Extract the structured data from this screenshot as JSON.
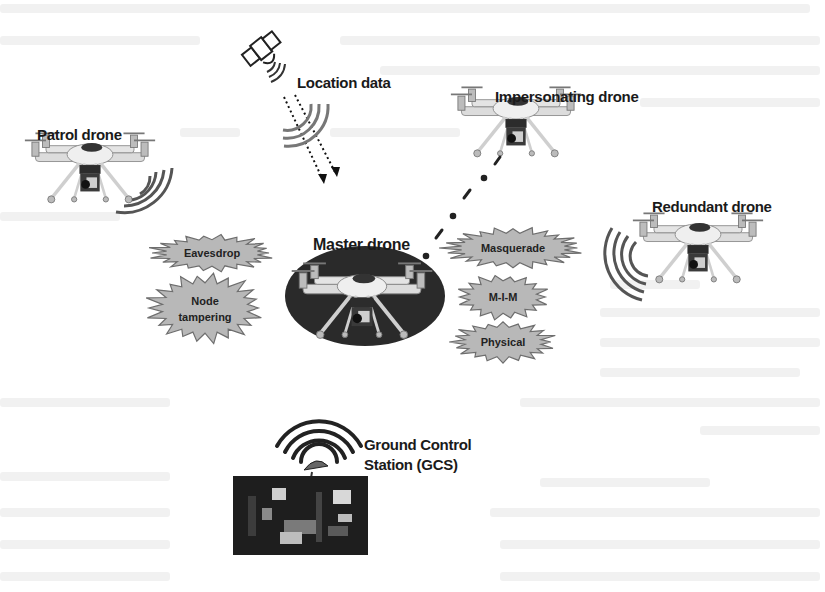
{
  "figure": {
    "nodes": {
      "satellite": {
        "label": "Location data",
        "icon": "satellite-icon"
      },
      "patrol": {
        "label": "Patrol drone",
        "icon": "drone-icon"
      },
      "impersonating": {
        "label": "Impersonating drone",
        "icon": "drone-icon"
      },
      "redundant": {
        "label": "Redundant drone",
        "icon": "drone-icon"
      },
      "master": {
        "label": "Master drone",
        "icon": "drone-icon"
      },
      "gcs": {
        "label_line1": "Ground Control",
        "label_line2": "Station (GCS)",
        "icon": "ground-station-icon"
      }
    },
    "attacks": [
      {
        "label": "Eavesdrop"
      },
      {
        "label_line1": "Node",
        "label_line2": "tampering"
      },
      {
        "label": "Masquerade"
      },
      {
        "label": "M-I-M"
      },
      {
        "label": "Physical"
      }
    ],
    "colors": {
      "burst_fill": "#b8b8b8",
      "burst_stroke": "#6e6e6e",
      "signal": "#555555",
      "master_ellipse": "#2a2a2a",
      "drone_body": "#e8e8e8"
    }
  }
}
